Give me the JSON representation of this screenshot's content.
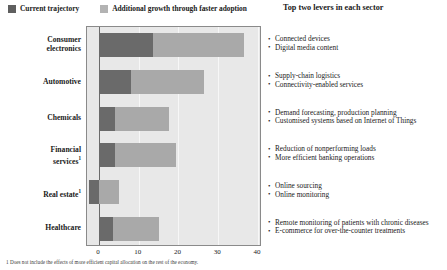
{
  "legend": {
    "entries": [
      {
        "label": "Current trajectory",
        "color": "#6a6a6a",
        "swatch": "dark"
      },
      {
        "label": "Additional growth through faster adoption",
        "color": "#a9a9a9",
        "swatch": "light"
      }
    ]
  },
  "levers_heading": "Top two levers in each sector",
  "footnotes": [
    "1 Does not include the effects of more efficient capital allocation on the rest of the economy."
  ],
  "levers": [
    {
      "sector": "Consumer electronics",
      "items": [
        "Connected devices",
        "Digital media content"
      ]
    },
    {
      "sector": "Automotive",
      "items": [
        "Supply-chain logistics",
        "Connectivity-enabled services"
      ]
    },
    {
      "sector": "Chemicals",
      "items": [
        "Demand forecasting, production planning",
        "Customised systems based on Internet of Things"
      ]
    },
    {
      "sector": "Financial services",
      "items": [
        "Reduction of nonperforming loads",
        "More efficient banking operations"
      ]
    },
    {
      "sector": "Real estate",
      "items": [
        "Online sourcing",
        "Online monitoring"
      ]
    },
    {
      "sector": "Healthcare",
      "items": [
        "Remote monitoring of patients with chronic diseases",
        "E-commerce for over-the-counter treatments"
      ]
    }
  ],
  "chart_data": {
    "type": "bar",
    "orientation": "horizontal",
    "stacked": true,
    "title": "",
    "xlabel": "",
    "ylabel": "",
    "xlim": [
      -3,
      41
    ],
    "xticks": [
      0,
      10,
      20,
      30,
      40
    ],
    "xtick_labels": [
      "0",
      "10",
      "20",
      "30",
      "40"
    ],
    "grid": true,
    "legend_position": "top-left",
    "categories": [
      "Consumer electronics",
      "Automotive",
      "Chemicals",
      "Financial services",
      "Real estate",
      "Healthcare"
    ],
    "category_labels": [
      {
        "line1": "Consumer",
        "line2": "electronics",
        "footnote": ""
      },
      {
        "line1": "Automotive",
        "line2": "",
        "footnote": ""
      },
      {
        "line1": "Chemicals",
        "line2": "",
        "footnote": ""
      },
      {
        "line1": "Financial",
        "line2": "services",
        "footnote": "1"
      },
      {
        "line1": "Real estate",
        "line2": "",
        "footnote": "1"
      },
      {
        "line1": "Healthcare",
        "line2": "",
        "footnote": ""
      }
    ],
    "series": [
      {
        "name": "Current trajectory",
        "color": "#6a6a6a",
        "values": [
          13.5,
          8.0,
          4.0,
          4.0,
          -2.5,
          3.5
        ]
      },
      {
        "name": "Additional growth through faster adoption",
        "color": "#a9a9a9",
        "values": [
          23.0,
          18.5,
          13.5,
          15.5,
          5.0,
          11.5
        ]
      }
    ],
    "bars": [
      {
        "category": "Consumer electronics",
        "current_start": 0,
        "current_end": 13.5,
        "additional_start": 13.5,
        "additional_end": 36.5
      },
      {
        "category": "Automotive",
        "current_start": 0,
        "current_end": 8.0,
        "additional_start": 8.0,
        "additional_end": 26.5
      },
      {
        "category": "Chemicals",
        "current_start": 0,
        "current_end": 4.0,
        "additional_start": 4.0,
        "additional_end": 17.5
      },
      {
        "category": "Financial services",
        "current_start": 0,
        "current_end": 4.0,
        "additional_start": 4.0,
        "additional_end": 19.5
      },
      {
        "category": "Real estate",
        "current_start": -2.5,
        "current_end": 0.0,
        "additional_start": 0.0,
        "additional_end": 5.0
      },
      {
        "category": "Healthcare",
        "current_start": 0,
        "current_end": 3.5,
        "additional_start": 3.5,
        "additional_end": 15.0
      }
    ]
  }
}
